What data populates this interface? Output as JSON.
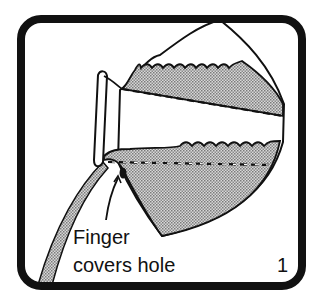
{
  "figure": {
    "caption_line1": "Finger",
    "caption_line2": "covers hole",
    "panel_number": "1",
    "colors": {
      "ink": "#111111",
      "liquid_fill": "#9a9a9a",
      "background": "#ffffff"
    }
  }
}
